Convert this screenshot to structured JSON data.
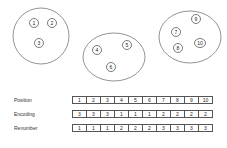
{
  "groups": [
    {
      "id": "group-1",
      "cx": 41,
      "cy": 36,
      "rx": 28,
      "ry": 28,
      "nodes": [
        {
          "label": "1",
          "x": 34,
          "y": 23
        },
        {
          "label": "2",
          "x": 52,
          "y": 23
        },
        {
          "label": "3",
          "x": 39,
          "y": 43
        }
      ]
    },
    {
      "id": "group-2",
      "cx": 114,
      "cy": 57,
      "rx": 31,
      "ry": 24,
      "nodes": [
        {
          "label": "4",
          "x": 97,
          "y": 50
        },
        {
          "label": "5",
          "x": 127,
          "y": 45
        },
        {
          "label": "6",
          "x": 111,
          "y": 67
        }
      ]
    },
    {
      "id": "group-3",
      "cx": 190,
      "cy": 37,
      "rx": 31,
      "ry": 26,
      "nodes": [
        {
          "label": "9",
          "x": 196,
          "y": 19
        },
        {
          "label": "7",
          "x": 176,
          "y": 32
        },
        {
          "label": "8",
          "x": 178,
          "y": 48
        },
        {
          "label": "10",
          "x": 200,
          "y": 43
        }
      ]
    }
  ],
  "table": {
    "rows": [
      {
        "label": "Position",
        "values": [
          "1",
          "2",
          "3",
          "4",
          "5",
          "6",
          "7",
          "8",
          "9",
          "10"
        ]
      },
      {
        "label": "Encoding",
        "values": [
          "3",
          "3",
          "3",
          "1",
          "1",
          "1",
          "2",
          "2",
          "2",
          "2"
        ]
      },
      {
        "label": "Renumber",
        "values": [
          "1",
          "1",
          "1",
          "2",
          "2",
          "2",
          "3",
          "3",
          "3",
          "3"
        ]
      }
    ]
  },
  "colors": {
    "stroke": "#777777",
    "node_stroke": "#444444",
    "text": "#222222"
  }
}
